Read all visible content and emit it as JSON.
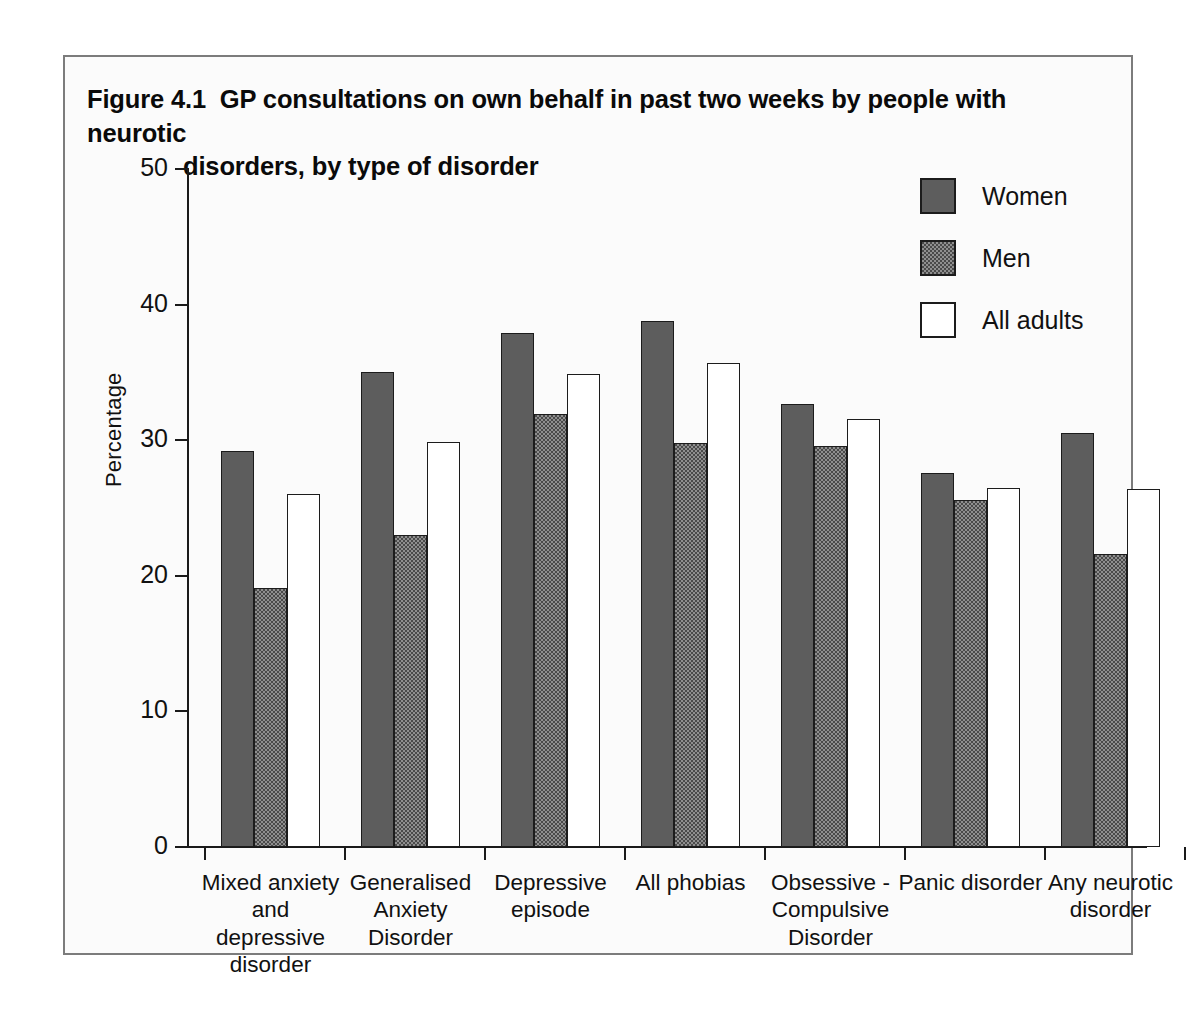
{
  "figure": {
    "number": "Figure 4.1",
    "title_line1": "GP consultations on own behalf in past two weeks by people with neurotic",
    "title_line2": "disorders, by type of disorder"
  },
  "chart_data": {
    "type": "bar",
    "xlabel": "",
    "ylabel": "Percentage",
    "ylim": [
      0,
      50
    ],
    "yticks": [
      0,
      10,
      20,
      30,
      40,
      50
    ],
    "ytick_labels": [
      "0",
      "10",
      "20",
      "30",
      "40",
      "50"
    ],
    "grid": false,
    "legend_position": "top-right",
    "categories": [
      "Mixed anxiety and depressive disorder",
      "Generalised Anxiety Disorder",
      "Depressive episode",
      "All phobias",
      "Obsessive - Compulsive Disorder",
      "Panic disorder",
      "Any neurotic disorder"
    ],
    "category_lines": [
      [
        "Mixed anxiety",
        "and",
        "depressive",
        "disorder"
      ],
      [
        "Generalised",
        "Anxiety",
        "Disorder"
      ],
      [
        "Depressive",
        "episode"
      ],
      [
        "All phobias"
      ],
      [
        "Obsessive -",
        "Compulsive",
        "Disorder"
      ],
      [
        "Panic disorder"
      ],
      [
        "Any neurotic",
        "disorder"
      ]
    ],
    "series": [
      {
        "name": "Women",
        "color": "#5d5d5d",
        "values": [
          29.2,
          35.0,
          37.9,
          38.8,
          32.7,
          27.6,
          30.5
        ]
      },
      {
        "name": "Men",
        "color": "#4a4a4a",
        "values": [
          19.1,
          23.0,
          31.9,
          29.8,
          29.6,
          25.6,
          21.6
        ]
      },
      {
        "name": "All adults",
        "color": "#ffffff",
        "values": [
          26.0,
          29.9,
          34.9,
          35.7,
          31.6,
          26.5,
          26.4
        ]
      }
    ]
  },
  "legend": {
    "items": [
      {
        "label": "Women",
        "swatch": "solid-gray-swatch"
      },
      {
        "label": "Men",
        "swatch": "hatched-gray-swatch"
      },
      {
        "label": "All adults",
        "swatch": "white-swatch"
      }
    ]
  }
}
